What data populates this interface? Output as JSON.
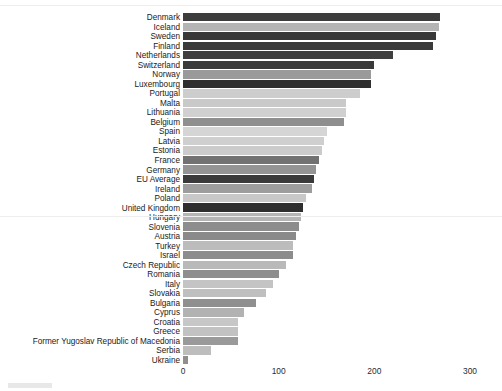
{
  "chart_data": {
    "type": "bar",
    "orientation": "horizontal",
    "title": "",
    "subtitle": "",
    "xlabel": "",
    "ylabel": "",
    "xlim": [
      0,
      300
    ],
    "xticks": [
      0,
      100,
      200,
      300
    ],
    "xtick_labels": [
      "0",
      "100",
      "200",
      "300"
    ],
    "grid": false,
    "legend": "none",
    "categories": [
      "Denmark",
      "Iceland",
      "Sweden",
      "Finland",
      "Netherlands",
      "Switzerland",
      "Norway",
      "Luxembourg",
      "Portugal",
      "Malta",
      "Lithuania",
      "Belgium",
      "Spain",
      "Latvia",
      "Estonia",
      "France",
      "Germany",
      "EU Average",
      "Ireland",
      "Poland",
      "United Kingdom",
      "Hungary",
      "Slovenia",
      "Austria",
      "Turkey",
      "Israel",
      "Czech Republic",
      "Romania",
      "Italy",
      "Slovakia",
      "Bulgaria",
      "Cyprus",
      "Croatia",
      "Greece",
      "Former Yugoslav Republic of Macedonia",
      "Serbia",
      "Ukraine"
    ],
    "values": [
      269,
      268,
      264,
      261,
      219,
      200,
      197,
      197,
      185,
      170,
      170,
      168,
      150,
      147,
      145,
      142,
      139,
      137,
      135,
      129,
      125,
      123,
      121,
      118,
      115,
      115,
      108,
      100,
      94,
      87,
      76,
      64,
      58,
      58,
      58,
      29,
      5
    ],
    "bar_colors": [
      "#3c3c3c",
      "#b4b4b4",
      "#383838",
      "#3a3a3a",
      "#3f3f3f",
      "#3a3a3a",
      "#9a9a9a",
      "#2f2f2f",
      "#cdcdcd",
      "#c9c9c9",
      "#d0d0d0",
      "#8f8f8f",
      "#d5d5d5",
      "#cfcfcf",
      "#cbcbcb",
      "#727272",
      "#949494",
      "#3a3a3a",
      "#9d9d9d",
      "#c8c8c8",
      "#2e2e2e",
      "#b5b5b5",
      "#8d8d8d",
      "#8a8a8a",
      "#bcbcbc",
      "#8c8c8c",
      "#b9b9b9",
      "#8e8e8e",
      "#c4c4c4",
      "#bfbfbf",
      "#8f8f8f",
      "#b2b2b2",
      "#c7c7c7",
      "#c2c2c2",
      "#9a9a9a",
      "#bdbdbd",
      "#8f8f8f"
    ]
  },
  "axis": {
    "origin_px": 183,
    "px_per_unit": 0.9567
  }
}
